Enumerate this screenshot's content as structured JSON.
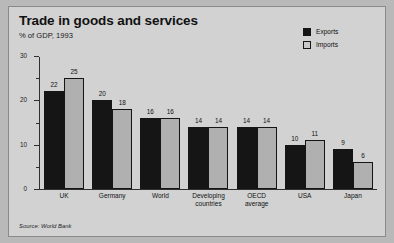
{
  "header": {
    "title": "Trade in goods and services",
    "subtitle": "% of GDP, 1993"
  },
  "legend": {
    "position": "top-right",
    "entries": [
      {
        "label": "Exports",
        "swatch": "exports-swatch",
        "color": "#151515"
      },
      {
        "label": "Imports",
        "swatch": "imports-swatch",
        "color": "#b0b0b0"
      }
    ]
  },
  "source": {
    "text": "Source: World Bank"
  },
  "colors": {
    "background": "#d2d2d2",
    "page": "#b9b9b9",
    "frame": "#8a8a8a",
    "axis": "#303030",
    "exports": "#151515",
    "imports": "#b0b0b0",
    "text": "#111111"
  },
  "chart_data": {
    "type": "bar",
    "title": "Trade in goods and services",
    "subtitle": "% of GDP, 1993",
    "xlabel": "",
    "ylabel": "",
    "ylim": [
      0,
      30
    ],
    "yticks": [
      0,
      10,
      20,
      30
    ],
    "yticks_minor": [
      5,
      15,
      25
    ],
    "ytick_labels": [
      "0",
      "10",
      "20",
      "30"
    ],
    "grid": false,
    "legend_position": "top-right",
    "source": "Source: World Bank",
    "categories": [
      "UK",
      "Germany",
      "World",
      "Developing\ncountries",
      "OECD\naverage",
      "USA",
      "Japan"
    ],
    "series": [
      {
        "name": "Exports",
        "color": "#151515",
        "values": [
          22,
          20,
          16,
          14,
          14,
          10,
          9
        ]
      },
      {
        "name": "Imports",
        "color": "#b0b0b0",
        "values": [
          25,
          18,
          16,
          14,
          14,
          11,
          6
        ]
      }
    ]
  }
}
